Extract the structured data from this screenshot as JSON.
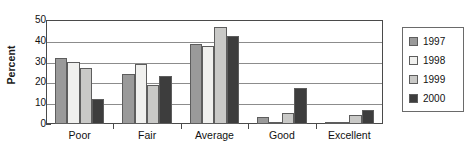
{
  "chart_data": {
    "type": "bar",
    "title": "",
    "xlabel": "",
    "ylabel": "Percent",
    "ylim": [
      0,
      50
    ],
    "yticks": [
      0,
      10,
      20,
      30,
      40,
      50
    ],
    "grid": true,
    "legend_position": "right",
    "categories": [
      "Poor",
      "Fair",
      "Average",
      "Good",
      "Excellent"
    ],
    "series": [
      {
        "name": "1997",
        "color": "#9a9a9a",
        "values": [
          31.5,
          24.1,
          38.6,
          3.3,
          0.6
        ]
      },
      {
        "name": "1998",
        "color": "#f0f0ee",
        "values": [
          30.0,
          28.8,
          37.6,
          1.0,
          0.8
        ]
      },
      {
        "name": "1999",
        "color": "#c9c9c7",
        "values": [
          26.9,
          18.8,
          46.6,
          5.5,
          4.2
        ]
      },
      {
        "name": "2000",
        "color": "#3d3d3d",
        "values": [
          12.0,
          23.1,
          42.2,
          17.5,
          6.8
        ]
      }
    ]
  },
  "legend": {
    "items": [
      {
        "label": "1997",
        "color": "#9a9a9a"
      },
      {
        "label": "1998",
        "color": "#f0f0ee",
        "icon": "legend-swatch-1998"
      },
      {
        "label": "1999",
        "color": "#c9c9c7"
      },
      {
        "label": "2000",
        "color": "#3d3d3d"
      }
    ]
  }
}
